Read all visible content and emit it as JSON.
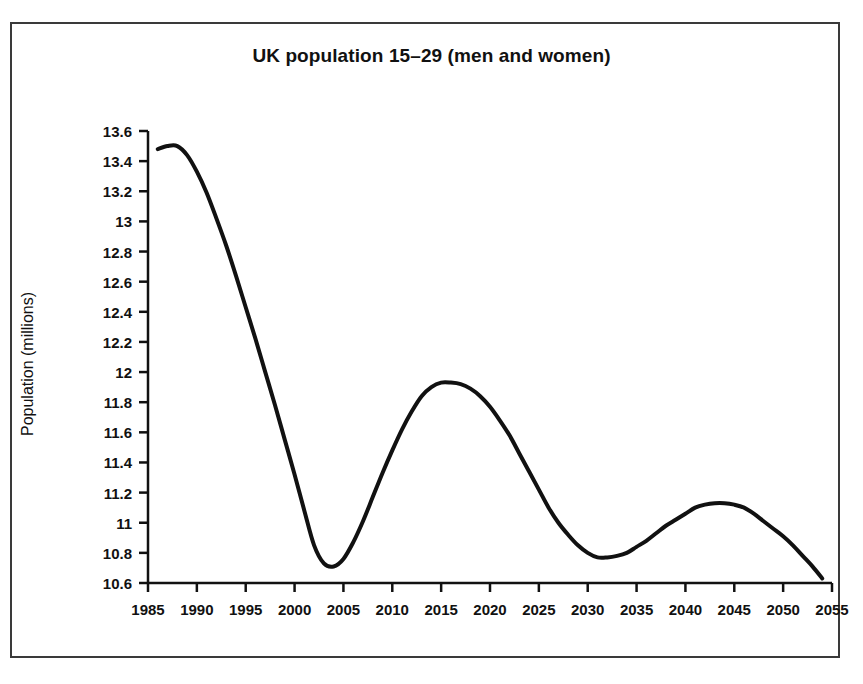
{
  "figure": {
    "border_color": "#3a3a3a",
    "background": "#ffffff"
  },
  "axis_titles": {
    "y": "Population (millions)"
  },
  "chart_data": {
    "type": "line",
    "title": "UK population 15–29 (men and women)",
    "xlabel": "",
    "ylabel": "Population (millions)",
    "xlim": [
      1985,
      2055
    ],
    "ylim": [
      10.6,
      13.6
    ],
    "grid": false,
    "legend": null,
    "line_color": "#111111",
    "line_width": 4,
    "markers": false,
    "x_ticks": [
      1985,
      1990,
      1995,
      2000,
      2005,
      2010,
      2015,
      2020,
      2025,
      2030,
      2035,
      2040,
      2045,
      2050,
      2055
    ],
    "x_tick_labels": [
      "1985",
      "1990",
      "1995",
      "2000",
      "2005",
      "2010",
      "2015",
      "2020",
      "2025",
      "2030",
      "2035",
      "2040",
      "2045",
      "2050",
      "2055"
    ],
    "y_ticks": [
      10.6,
      10.8,
      11,
      11.2,
      11.4,
      11.6,
      11.8,
      12,
      12.2,
      12.4,
      12.6,
      12.8,
      13,
      13.2,
      13.4,
      13.6
    ],
    "y_tick_labels": [
      "10.6",
      "10.8",
      "11",
      "11.2",
      "11.4",
      "11.6",
      "11.8",
      "12",
      "12.2",
      "12.4",
      "12.6",
      "12.8",
      "13",
      "13.2",
      "13.4",
      "13.6"
    ],
    "series": [
      {
        "name": "UK population aged 15-29",
        "x": [
          1986,
          1987,
          1988,
          1989,
          1990,
          1991,
          1992,
          1993,
          1994,
          1995,
          1996,
          1997,
          1998,
          1999,
          2000,
          2001,
          2002,
          2003,
          2004,
          2005,
          2006,
          2007,
          2008,
          2009,
          2010,
          2011,
          2012,
          2013,
          2014,
          2015,
          2016,
          2017,
          2018,
          2019,
          2020,
          2021,
          2022,
          2023,
          2024,
          2025,
          2026,
          2027,
          2028,
          2029,
          2030,
          2031,
          2032,
          2033,
          2034,
          2035,
          2036,
          2037,
          2038,
          2039,
          2040,
          2041,
          2042,
          2043,
          2044,
          2045,
          2046,
          2047,
          2048,
          2049,
          2050,
          2051,
          2052,
          2053,
          2054
        ],
        "y": [
          13.48,
          13.5,
          13.5,
          13.44,
          13.33,
          13.19,
          13.02,
          12.84,
          12.64,
          12.43,
          12.22,
          12.0,
          11.78,
          11.55,
          11.32,
          11.08,
          10.85,
          10.73,
          10.71,
          10.76,
          10.87,
          11.01,
          11.17,
          11.33,
          11.48,
          11.62,
          11.74,
          11.84,
          11.9,
          11.93,
          11.93,
          11.92,
          11.89,
          11.84,
          11.77,
          11.68,
          11.58,
          11.46,
          11.34,
          11.22,
          11.1,
          11.0,
          10.92,
          10.85,
          10.8,
          10.77,
          10.77,
          10.78,
          10.8,
          10.84,
          10.88,
          10.93,
          10.98,
          11.02,
          11.06,
          11.1,
          11.12,
          11.13,
          11.13,
          11.12,
          11.1,
          11.06,
          11.01,
          10.96,
          10.91,
          10.85,
          10.78,
          10.71,
          10.63
        ]
      }
    ],
    "annotations": {
      "initial_peak_year": 1987,
      "initial_peak_value": 13.5,
      "first_trough_year": 2004,
      "first_trough_value": 10.71,
      "second_peak_year": 2016,
      "second_peak_value": 11.93,
      "second_trough_year": 2031,
      "second_trough_value": 10.77,
      "third_peak_year": 2043,
      "third_peak_value": 11.13,
      "final_year": 2054,
      "final_value": 10.63
    }
  }
}
